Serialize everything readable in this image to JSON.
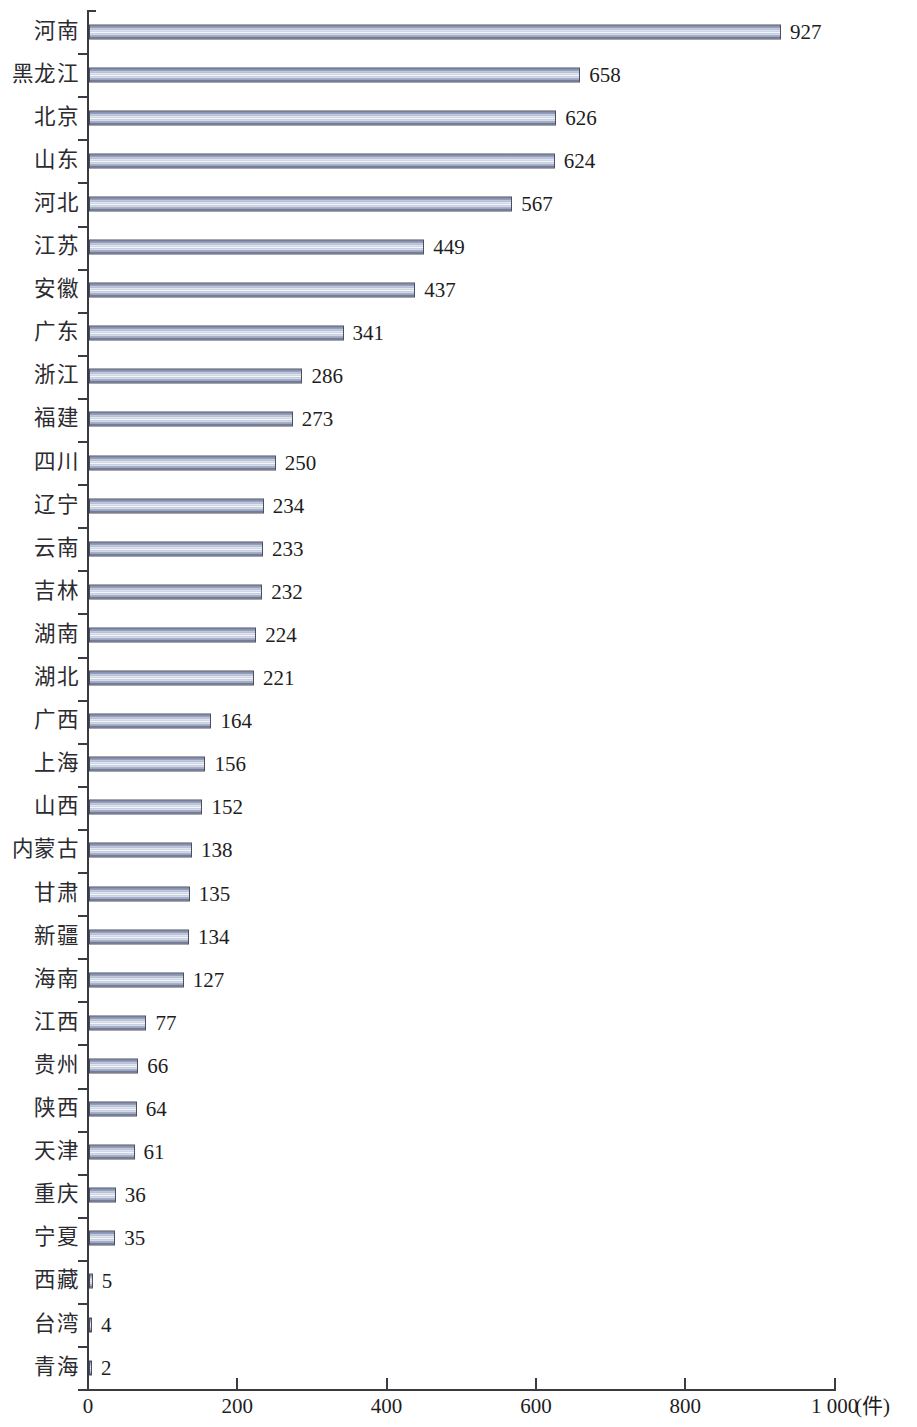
{
  "chart_data": {
    "type": "bar",
    "orientation": "horizontal",
    "title": "",
    "subtitle": "",
    "xlabel": "(件)",
    "ylabel": "",
    "xlim": [
      0,
      1000
    ],
    "grid": false,
    "legend": null,
    "x_tick_labels": [
      "0",
      "200",
      "400",
      "600",
      "800",
      "1 000"
    ],
    "x_tick_values": [
      0,
      200,
      400,
      600,
      800,
      1000
    ],
    "unit_label": "(件)",
    "categories": [
      "河南",
      "黑龙江",
      "北京",
      "山东",
      "河北",
      "江苏",
      "安徽",
      "广东",
      "浙江",
      "福建",
      "四川",
      "辽宁",
      "云南",
      "吉林",
      "湖南",
      "湖北",
      "广西",
      "上海",
      "山西",
      "内蒙古",
      "甘肃",
      "新疆",
      "海南",
      "江西",
      "贵州",
      "陕西",
      "天津",
      "重庆",
      "宁夏",
      "西藏",
      "台湾",
      "青海"
    ],
    "values": [
      927,
      658,
      626,
      624,
      567,
      449,
      437,
      341,
      286,
      273,
      250,
      234,
      233,
      232,
      224,
      221,
      164,
      156,
      152,
      138,
      135,
      134,
      127,
      77,
      66,
      64,
      61,
      36,
      35,
      5,
      4,
      2
    ],
    "value_labels": [
      "927",
      "658",
      "626",
      "624",
      "567",
      "449",
      "437",
      "341",
      "286",
      "273",
      "250",
      "234",
      "233",
      "232",
      "224",
      "221",
      "164",
      "156",
      "152",
      "138",
      "135",
      "134",
      "127",
      "77",
      "66",
      "64",
      "61",
      "36",
      "35",
      "5",
      "4",
      "2"
    ],
    "colors": {
      "bar_edge": "#4a4f63",
      "bar_fill_light": "#f7f9fc",
      "bar_fill_dark": "#515874",
      "axis": "#3b3b42",
      "text": "#1d1d22"
    }
  }
}
